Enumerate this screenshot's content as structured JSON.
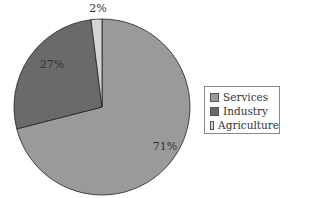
{
  "chart_data": {
    "type": "pie",
    "title": "",
    "categories": [
      "Services",
      "Industry",
      "Agriculture"
    ],
    "values": [
      71,
      27,
      2
    ],
    "labels": [
      "71%",
      "27%",
      "2%"
    ],
    "colors": [
      "#9a9a9a",
      "#6a6a6a",
      "#d4d4d4"
    ],
    "legend": {
      "position": "right",
      "entries": [
        "Services",
        "Industry",
        "Agriculture"
      ]
    }
  }
}
